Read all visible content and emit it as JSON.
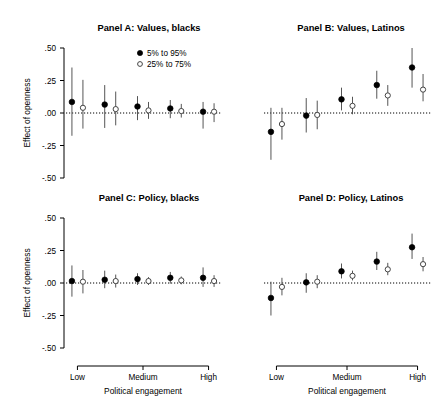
{
  "figure": {
    "width": 439,
    "height": 418,
    "background": "#ffffff",
    "ink": "#000000"
  },
  "chart_data": {
    "type": "scatter",
    "title": "",
    "subtitle": "",
    "xlabel": "Political engagement",
    "ylabel": "Effect of openness",
    "ylim": [
      -0.5,
      0.5
    ],
    "yticks": [
      0.5,
      0.25,
      0.0,
      -0.25,
      -0.5
    ],
    "ytick_labels": [
      ".50",
      ".25",
      ".00",
      "-.25",
      "-.50"
    ],
    "xtick_labels": [
      "Low",
      "Medium",
      "High"
    ],
    "xtick_positions": [
      1,
      3,
      5
    ],
    "x": [
      1,
      2,
      3,
      4,
      5
    ],
    "grid": false,
    "zero_reference_line": true,
    "legend_position": "top-right of Panel A",
    "legend": [
      {
        "marker": "filled-circle",
        "label": "5% to 95%"
      },
      {
        "marker": "open-circle",
        "label": "25% to 75%"
      }
    ],
    "panels": [
      {
        "id": "A",
        "title": "Panel A: Values, blacks",
        "series": [
          {
            "name": "5% to 95%",
            "marker": "filled-circle",
            "estimates": [
              0.085,
              0.065,
              0.05,
              0.035,
              0.01
            ],
            "lower": [
              -0.175,
              -0.115,
              -0.055,
              -0.04,
              -0.12
            ],
            "upper": [
              0.35,
              0.215,
              0.13,
              0.1,
              0.085
            ]
          },
          {
            "name": "25% to 75%",
            "marker": "open-circle",
            "estimates": [
              0.04,
              0.03,
              0.02,
              0.015,
              0.01
            ],
            "lower": [
              -0.12,
              -0.095,
              -0.045,
              -0.035,
              -0.07
            ],
            "upper": [
              0.255,
              0.165,
              0.085,
              0.07,
              0.075
            ]
          }
        ]
      },
      {
        "id": "B",
        "title": "Panel B: Values, Latinos",
        "series": [
          {
            "name": "5% to 95%",
            "marker": "filled-circle",
            "estimates": [
              -0.145,
              -0.02,
              0.105,
              0.215,
              0.35
            ],
            "lower": [
              -0.36,
              -0.15,
              0.02,
              0.11,
              0.195
            ],
            "upper": [
              0.04,
              0.115,
              0.195,
              0.325,
              0.5
            ]
          },
          {
            "name": "25% to 75%",
            "marker": "open-circle",
            "estimates": [
              -0.085,
              -0.015,
              0.055,
              0.135,
              0.18
            ],
            "lower": [
              -0.205,
              -0.125,
              -0.01,
              0.055,
              0.09
            ],
            "upper": [
              0.04,
              0.095,
              0.125,
              0.215,
              0.3
            ]
          }
        ]
      },
      {
        "id": "C",
        "title": "Panel C: Policy, blacks",
        "series": [
          {
            "name": "5% to 95%",
            "marker": "filled-circle",
            "estimates": [
              0.015,
              0.025,
              0.03,
              0.04,
              0.04
            ],
            "lower": [
              -0.105,
              -0.04,
              -0.015,
              -0.005,
              -0.03
            ],
            "upper": [
              0.135,
              0.095,
              0.075,
              0.085,
              0.12
            ]
          },
          {
            "name": "25% to 75%",
            "marker": "open-circle",
            "estimates": [
              0.01,
              0.015,
              0.015,
              0.02,
              0.015
            ],
            "lower": [
              -0.08,
              -0.035,
              -0.015,
              -0.01,
              -0.03
            ],
            "upper": [
              0.1,
              0.065,
              0.045,
              0.05,
              0.06
            ]
          }
        ]
      },
      {
        "id": "D",
        "title": "Panel D: Policy, Latinos",
        "series": [
          {
            "name": "5% to 95%",
            "marker": "filled-circle",
            "estimates": [
              -0.115,
              0.005,
              0.09,
              0.165,
              0.275
            ],
            "lower": [
              -0.25,
              -0.075,
              0.035,
              0.1,
              0.185
            ],
            "upper": [
              0.01,
              0.075,
              0.15,
              0.24,
              0.38
            ]
          },
          {
            "name": "25% to 75%",
            "marker": "open-circle",
            "estimates": [
              -0.03,
              0.01,
              0.055,
              0.105,
              0.145
            ],
            "lower": [
              -0.095,
              -0.04,
              0.02,
              0.06,
              0.09
            ],
            "upper": [
              0.04,
              0.06,
              0.095,
              0.155,
              0.2
            ]
          }
        ]
      }
    ]
  }
}
